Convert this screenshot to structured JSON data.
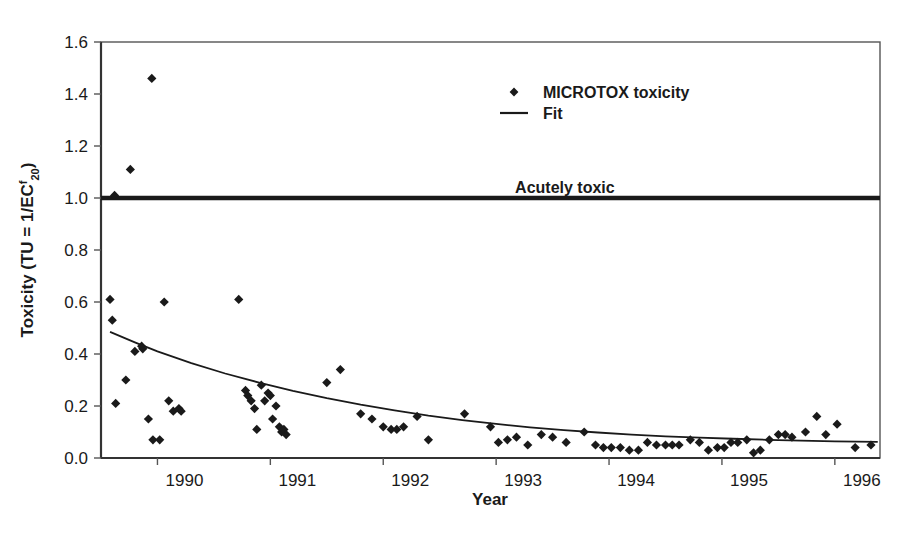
{
  "chart_data": {
    "type": "scatter",
    "title": "",
    "xlabel": "Year",
    "ylabel": "Toxicity (TU = 1/EC",
    "ylabel_sup": "f",
    "ylabel_sub": "20",
    "ylabel_tail": ")",
    "xlim": [
      1989.5,
      1996.4
    ],
    "ylim": [
      0.0,
      1.6
    ],
    "grid": false,
    "legend_position": "top-center",
    "xticks": [
      1990,
      1991,
      1992,
      1993,
      1994,
      1995,
      1996
    ],
    "xtick_labels": [
      "1990",
      "1991",
      "1992",
      "1993",
      "1994",
      "1995",
      "1996"
    ],
    "yticks": [
      0.0,
      0.2,
      0.4,
      0.6,
      0.8,
      1.0,
      1.2,
      1.4,
      1.6
    ],
    "ytick_labels": [
      "0.0",
      "0.2",
      "0.4",
      "0.6",
      "0.8",
      "1.0",
      "1.2",
      "1.4",
      "1.6"
    ],
    "series": [
      {
        "name": "MICROTOX toxicity",
        "type": "scatter",
        "marker": "diamond",
        "color": "#1a1a1a",
        "points": [
          [
            1989.62,
            1.01
          ],
          [
            1989.76,
            1.11
          ],
          [
            1989.95,
            1.46
          ],
          [
            1989.58,
            0.61
          ],
          [
            1989.6,
            0.53
          ],
          [
            1989.63,
            0.21
          ],
          [
            1989.72,
            0.3
          ],
          [
            1989.8,
            0.41
          ],
          [
            1989.86,
            0.43
          ],
          [
            1989.87,
            0.42
          ],
          [
            1989.92,
            0.15
          ],
          [
            1989.96,
            0.07
          ],
          [
            1990.02,
            0.07
          ],
          [
            1990.06,
            0.6
          ],
          [
            1990.1,
            0.22
          ],
          [
            1990.14,
            0.18
          ],
          [
            1990.19,
            0.19
          ],
          [
            1990.21,
            0.18
          ],
          [
            1990.72,
            0.61
          ],
          [
            1990.78,
            0.26
          ],
          [
            1990.8,
            0.24
          ],
          [
            1990.83,
            0.22
          ],
          [
            1990.86,
            0.19
          ],
          [
            1990.88,
            0.11
          ],
          [
            1990.92,
            0.28
          ],
          [
            1990.95,
            0.22
          ],
          [
            1990.98,
            0.25
          ],
          [
            1991.0,
            0.24
          ],
          [
            1991.02,
            0.15
          ],
          [
            1991.05,
            0.2
          ],
          [
            1991.08,
            0.12
          ],
          [
            1991.1,
            0.1
          ],
          [
            1991.12,
            0.11
          ],
          [
            1991.14,
            0.09
          ],
          [
            1991.5,
            0.29
          ],
          [
            1991.62,
            0.34
          ],
          [
            1991.8,
            0.17
          ],
          [
            1991.9,
            0.15
          ],
          [
            1992.0,
            0.12
          ],
          [
            1992.07,
            0.11
          ],
          [
            1992.12,
            0.11
          ],
          [
            1992.18,
            0.12
          ],
          [
            1992.3,
            0.16
          ],
          [
            1992.4,
            0.07
          ],
          [
            1992.72,
            0.17
          ],
          [
            1992.95,
            0.12
          ],
          [
            1993.02,
            0.06
          ],
          [
            1993.1,
            0.07
          ],
          [
            1993.18,
            0.08
          ],
          [
            1993.28,
            0.05
          ],
          [
            1993.4,
            0.09
          ],
          [
            1993.5,
            0.08
          ],
          [
            1993.62,
            0.06
          ],
          [
            1993.78,
            0.1
          ],
          [
            1993.88,
            0.05
          ],
          [
            1993.95,
            0.04
          ],
          [
            1994.02,
            0.04
          ],
          [
            1994.1,
            0.04
          ],
          [
            1994.18,
            0.03
          ],
          [
            1994.26,
            0.03
          ],
          [
            1994.34,
            0.06
          ],
          [
            1994.42,
            0.05
          ],
          [
            1994.5,
            0.05
          ],
          [
            1994.56,
            0.05
          ],
          [
            1994.62,
            0.05
          ],
          [
            1994.72,
            0.07
          ],
          [
            1994.8,
            0.06
          ],
          [
            1994.88,
            0.03
          ],
          [
            1994.96,
            0.04
          ],
          [
            1995.02,
            0.04
          ],
          [
            1995.08,
            0.06
          ],
          [
            1995.14,
            0.06
          ],
          [
            1995.22,
            0.07
          ],
          [
            1995.28,
            0.02
          ],
          [
            1995.34,
            0.03
          ],
          [
            1995.42,
            0.07
          ],
          [
            1995.5,
            0.09
          ],
          [
            1995.56,
            0.09
          ],
          [
            1995.62,
            0.08
          ],
          [
            1995.74,
            0.1
          ],
          [
            1995.84,
            0.16
          ],
          [
            1995.92,
            0.09
          ],
          [
            1996.02,
            0.13
          ],
          [
            1996.18,
            0.04
          ],
          [
            1996.32,
            0.05
          ]
        ]
      },
      {
        "name": "Fit",
        "type": "line",
        "color": "#1a1a1a",
        "points": [
          [
            1989.58,
            0.485
          ],
          [
            1989.8,
            0.445
          ],
          [
            1990.0,
            0.41
          ],
          [
            1990.3,
            0.365
          ],
          [
            1990.6,
            0.325
          ],
          [
            1990.9,
            0.29
          ],
          [
            1991.2,
            0.258
          ],
          [
            1991.5,
            0.23
          ],
          [
            1991.8,
            0.205
          ],
          [
            1992.1,
            0.183
          ],
          [
            1992.4,
            0.163
          ],
          [
            1992.7,
            0.146
          ],
          [
            1993.0,
            0.131
          ],
          [
            1993.3,
            0.118
          ],
          [
            1993.6,
            0.107
          ],
          [
            1993.9,
            0.098
          ],
          [
            1994.2,
            0.09
          ],
          [
            1994.5,
            0.083
          ],
          [
            1994.8,
            0.078
          ],
          [
            1995.1,
            0.074
          ],
          [
            1995.4,
            0.07
          ],
          [
            1995.7,
            0.067
          ],
          [
            1996.0,
            0.064
          ],
          [
            1996.38,
            0.062
          ]
        ]
      }
    ],
    "annotations": [
      {
        "name": "acutely-toxic-threshold",
        "label": "Acutely toxic",
        "y": 1.0,
        "label_x": 1994.05
      }
    ]
  },
  "legend": {
    "items": [
      {
        "label": "MICROTOX toxicity",
        "marker": "diamond"
      },
      {
        "label": "Fit",
        "marker": "line"
      }
    ]
  }
}
